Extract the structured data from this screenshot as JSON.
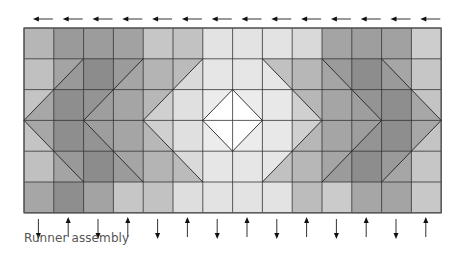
{
  "caption": "Runner assembly",
  "grid": {
    "columns": 14,
    "rows": 6,
    "x0": 24,
    "y0": 28,
    "cell_w": 29.8,
    "cell_h": 30.8,
    "line_color": "#333333",
    "border_color": "#555555"
  },
  "top_arrows": {
    "direction": "left",
    "count": 14,
    "y": 19
  },
  "bottom_arrows": {
    "directions": [
      "down",
      "up",
      "down",
      "up",
      "down",
      "up",
      "down",
      "up",
      "down",
      "up",
      "down",
      "up",
      "down",
      "up"
    ],
    "y_top": 219,
    "y_bottom": 237
  },
  "cell_colors": [
    [
      "#b6b6b6",
      "#9a9a9a",
      "#9c9c9c",
      "#a2a2a2",
      "#c6c6c6",
      "#c2c2c2",
      "#e3e3e3",
      "#e3e3e3",
      "#e3e3e3",
      "#d9d9d9",
      "#a4a4a4",
      "#9e9e9e",
      "#a1a1a1",
      "#cdcdcd"
    ],
    [
      "#c0c0c0",
      "#a4a4a4",
      "#878787",
      "#a8a8a8",
      "#cacaca",
      "#dadada",
      "#e6e6e6",
      "#e6e6e6",
      "#e6e6e6",
      "#d0d0d0",
      "#a8a8a8",
      "#8a8a8a",
      "#a6a6a6",
      "#c6c6c6"
    ],
    [
      "#c4c4c4",
      "#8c8c8c",
      "#9a9a9a",
      "#a8a8a8",
      "#d0d0d0",
      "#e0e0e0",
      "#ececec",
      "#ececec",
      "#e8e8e8",
      "#d0d0d0",
      "#a8a8a8",
      "#9a9a9a",
      "#8c8c8c",
      "#c4c4c4"
    ],
    [
      "#c4c4c4",
      "#8c8c8c",
      "#9a9a9a",
      "#a8a8a8",
      "#d0d0d0",
      "#e0e0e0",
      "#ececec",
      "#ececec",
      "#e8e8e8",
      "#d0d0d0",
      "#a8a8a8",
      "#9a9a9a",
      "#8c8c8c",
      "#c4c4c4"
    ],
    [
      "#c0c0c0",
      "#a4a4a4",
      "#878787",
      "#a8a8a8",
      "#cacaca",
      "#dadada",
      "#e6e6e6",
      "#e6e6e6",
      "#e6e6e6",
      "#d0d0d0",
      "#a8a8a8",
      "#8a8a8a",
      "#a6a6a6",
      "#c6c6c6"
    ],
    [
      "#a6a6a6",
      "#8e8e8e",
      "#a3a3a3",
      "#c6c6c6",
      "#c2c2c2",
      "#dedede",
      "#e3e3e3",
      "#e3e3e3",
      "#e3e3e3",
      "#bcbcbc",
      "#cbcbcb",
      "#a6a6a6",
      "#a4a4a4",
      "#c8c8c8"
    ]
  ],
  "chevron_fills": {
    "outer_band": "#8f8f8f",
    "mid_band": "#a3a3a3",
    "inner_band": "#d2d2d2",
    "diamond": "#ffffff"
  }
}
